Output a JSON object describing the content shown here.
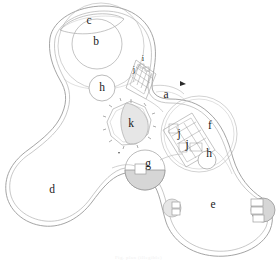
{
  "figure": {
    "kind": "architectural-site-plan",
    "title": "",
    "caption": "Fig. plan (illegible)",
    "background_color": "#ffffff",
    "line_color": "#9a9a9a",
    "secondary_line_color": "#b4b4b4",
    "fill_gray": "#d6d6d6",
    "fill_light_gray": "#e6e6e6",
    "label_color": "#1a1a1a"
  },
  "labels": [
    {
      "id": "a",
      "text": "a",
      "x": 166,
      "y": 95,
      "size": "large",
      "note": "junction / passage between north lobe and east lobe"
    },
    {
      "id": "b",
      "text": "b",
      "x": 96,
      "y": 42,
      "size": "large",
      "note": "inner circular chamber of north lobe"
    },
    {
      "id": "c",
      "text": "c",
      "x": 89,
      "y": 21,
      "size": "large",
      "note": "lens-shaped area at top of north lobe"
    },
    {
      "id": "d",
      "text": "d",
      "x": 52,
      "y": 190,
      "size": "large",
      "note": "south-west lobe"
    },
    {
      "id": "e",
      "text": "e",
      "x": 213,
      "y": 205,
      "size": "large",
      "note": "south-east lobe"
    },
    {
      "id": "f",
      "text": "f",
      "x": 210,
      "y": 126,
      "size": "large",
      "note": "east circular chamber"
    },
    {
      "id": "g",
      "text": "g",
      "x": 148,
      "y": 164,
      "size": "large",
      "note": "central shaded circular feature"
    },
    {
      "id": "h1",
      "text": "h",
      "x": 102,
      "y": 88,
      "size": "large",
      "note": "circular feature on north-west wall"
    },
    {
      "id": "h2",
      "text": "h",
      "x": 209,
      "y": 154,
      "size": "large",
      "note": "circular feature on east chamber wall"
    },
    {
      "id": "i",
      "text": "i",
      "x": 143,
      "y": 59,
      "size": "small",
      "note": "small detail in north-east annex"
    },
    {
      "id": "j1",
      "text": "j",
      "x": 134,
      "y": 70,
      "size": "small",
      "note": "compartment in north-east annex"
    },
    {
      "id": "j2",
      "text": "j",
      "x": 179,
      "y": 134,
      "size": "large",
      "note": "compartment in east chamber"
    },
    {
      "id": "j3",
      "text": "j",
      "x": 187,
      "y": 145,
      "size": "large",
      "note": "compartment in east chamber"
    },
    {
      "id": "k",
      "text": "k",
      "x": 131,
      "y": 124,
      "size": "large",
      "note": "central polygonal feature with radial ticks"
    }
  ],
  "features": {
    "north_lobe": "large rounded lobe upper-left containing chambers b and c",
    "southwest_lobe": "large rounded lobe lower-left, room d",
    "southeast_lobe": "large rounded lobe lower-right, room e",
    "east_chamber": "circle right of centre containing f, j, j, h",
    "central_polygon": "faceted ring with radial tick marks, room k",
    "central_circle": "circle g with gray filled lower half",
    "annex": "small angled grid structure at top centre near i and j",
    "pointer_arrow": "small solid arrow mark right of a"
  }
}
